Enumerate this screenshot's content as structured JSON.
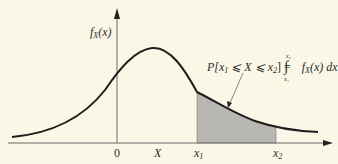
{
  "diagram": {
    "type": "probability-density-plot",
    "colors": {
      "background": "#fbf7e6",
      "curve": "#1e1e1e",
      "axis": "#6a6a6a",
      "shaded_area": "#b9b7b1"
    },
    "y_axis": {
      "label": "f",
      "label_sub": "X",
      "label_arg": "(x)"
    },
    "x_axis": {
      "ticks": [
        {
          "id": "origin",
          "label": "0"
        },
        {
          "id": "mean",
          "label": "X"
        },
        {
          "id": "x1",
          "label": "x",
          "sub": "1"
        },
        {
          "id": "x2",
          "label": "x",
          "sub": "2"
        }
      ]
    },
    "annotation": {
      "lhs": "P[x",
      "lhs_sub1": "1",
      "lhs_mid": " ⩽ X ⩽ x",
      "lhs_sub2": "2",
      "lhs_end": "] = ",
      "integral_symbol": "∫",
      "upper_limit": "x₂",
      "lower_limit": "x₁",
      "integrand": "f",
      "integrand_sub": "X",
      "integrand_rest": "(x) dx"
    }
  }
}
